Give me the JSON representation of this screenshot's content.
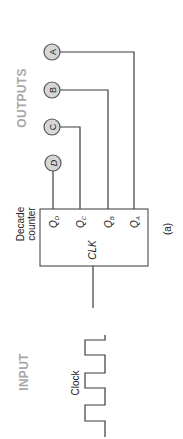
{
  "diagram": {
    "caption": "(a)",
    "sections": {
      "outputs_label": "OUTPUTS",
      "input_label": "INPUT"
    },
    "counter": {
      "title_line1": "Decade",
      "title_line2": "counter",
      "clock_pin": "CLK",
      "outputs": [
        {
          "q": "Q",
          "sub": "D",
          "node": "D"
        },
        {
          "q": "Q",
          "sub": "C",
          "node": "C"
        },
        {
          "q": "Q",
          "sub": "B",
          "node": "B"
        },
        {
          "q": "Q",
          "sub": "A",
          "node": "A"
        }
      ]
    },
    "input": {
      "signal_label": "Clock"
    },
    "colors": {
      "section_text": "#a8a8a8",
      "node_fill": "#d6d6d6",
      "line": "#3a3a3a"
    }
  }
}
